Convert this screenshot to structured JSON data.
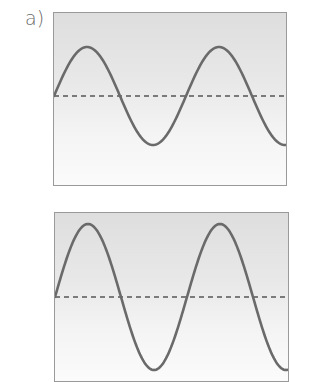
{
  "figure": {
    "panels": [
      {
        "label": "a)",
        "description": "Sine wave with lower amplitude around a dashed midline",
        "wave": {
          "cycles_visible": 1.75,
          "period_px": 132,
          "amplitude_px": 49,
          "midline_y_px": 83,
          "start_phase": "midline rising"
        }
      },
      {
        "label": "",
        "description": "Sine wave with larger amplitude around a dashed midline, same frequency",
        "wave": {
          "cycles_visible": 1.75,
          "period_px": 132,
          "amplitude_px": 73,
          "midline_y_px": 84,
          "start_phase": "midline rising"
        }
      }
    ],
    "colors": {
      "curve": "#6a6a6a",
      "midline": "#555555",
      "border": "#9a9a9a",
      "background_top": "#dedede",
      "background_bottom": "#fbfbfb",
      "label": "#6a6a6a"
    }
  }
}
